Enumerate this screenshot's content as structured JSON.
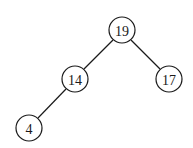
{
  "diagram": {
    "type": "binary-tree",
    "nodes": [
      {
        "id": "n19",
        "label": "19",
        "x": 122,
        "y": 30,
        "r": 13
      },
      {
        "id": "n14",
        "label": "14",
        "x": 75,
        "y": 79,
        "r": 13
      },
      {
        "id": "n17",
        "label": "17",
        "x": 169,
        "y": 79,
        "r": 13
      },
      {
        "id": "n4",
        "label": "4",
        "x": 29,
        "y": 128,
        "r": 13
      }
    ],
    "edges": [
      {
        "from": "n19",
        "to": "n14"
      },
      {
        "from": "n19",
        "to": "n17"
      },
      {
        "from": "n14",
        "to": "n4"
      }
    ]
  }
}
